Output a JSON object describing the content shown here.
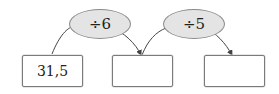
{
  "diagram": {
    "operators": [
      {
        "label": "÷6"
      },
      {
        "label": "÷5"
      }
    ],
    "boxes": [
      {
        "value": "31,5"
      },
      {
        "value": ""
      },
      {
        "value": ""
      }
    ],
    "colors": {
      "oval_fill": "#e4e4e4",
      "oval_border": "#8a8a8a",
      "box_border": "#7a7a7a",
      "arrow": "#444444",
      "text": "#222222"
    }
  }
}
